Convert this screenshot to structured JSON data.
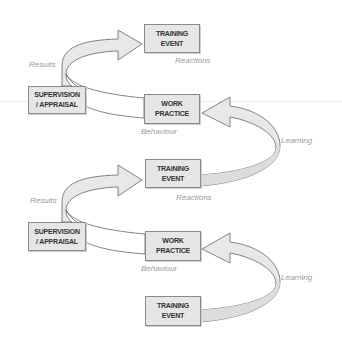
{
  "diagram": {
    "type": "cycle-flow",
    "colors": {
      "box_fill": "#e6e6e6",
      "box_border": "#8a8a8a",
      "arrow_fill": "#e8e8e8",
      "arrow_stroke": "#666666",
      "label": "#9a9a9a"
    },
    "cycles": [
      {
        "training_event": {
          "line1": "TRAINING",
          "line2": "EVENT"
        },
        "supervision": {
          "line1": "SUPERVISION",
          "line2": "/ APPRAISAL"
        },
        "work_practice": {
          "line1": "WORK",
          "line2": "PRACTICE"
        },
        "labels": {
          "results": "Results",
          "reactions": "Reactions",
          "behaviour": "Behaviour",
          "learning": "Learning"
        }
      },
      {
        "training_event": {
          "line1": "TRAINING",
          "line2": "EVENT"
        },
        "supervision": {
          "line1": "SUPERVISION",
          "line2": "/ APPRAISAL"
        },
        "work_practice": {
          "line1": "WORK",
          "line2": "PRACTICE"
        },
        "labels": {
          "results": "Results",
          "reactions": "Reactions",
          "behaviour": "Behaviour",
          "learning": "Learning"
        }
      }
    ],
    "base_training_event": {
      "line1": "TRAINING",
      "line2": "EVENT"
    }
  }
}
